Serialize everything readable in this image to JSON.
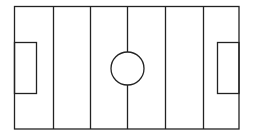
{
  "diagram": {
    "type": "soccer-field-outline",
    "stroke_color": "#222222",
    "background": "#ffffff",
    "field": {
      "x": 14.5,
      "y": 6.5,
      "width": 224.5,
      "height": 122.5
    },
    "division_lines_x": [
      53.5,
      90.5,
      165.5,
      203.5
    ],
    "halfway_line_x": 127.5,
    "center_circle": {
      "cx": 127.5,
      "cy": 68.5,
      "r": 16.5
    },
    "left_box": {
      "x": 14.5,
      "y": 42.5,
      "width": 22,
      "height": 51
    },
    "right_box": {
      "x": 217.5,
      "y": 42.5,
      "width": 21.5,
      "height": 51
    }
  }
}
